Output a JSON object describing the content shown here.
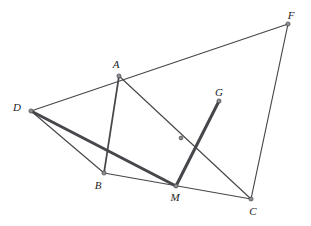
{
  "figure": {
    "canvas": {
      "width": 311,
      "height": 226
    },
    "background_color": "#ffffff",
    "line_color": "#46464b",
    "vertex_color": "#8d8d93",
    "label_color": "#1c1c1e",
    "points": [
      {
        "id": "D",
        "label": "D",
        "x": 31,
        "y": 111,
        "label_x": 17,
        "label_y": 107,
        "labeled": true
      },
      {
        "id": "A",
        "label": "A",
        "x": 119,
        "y": 76,
        "label_x": 116,
        "label_y": 64,
        "labeled": true
      },
      {
        "id": "F",
        "label": "F",
        "x": 288,
        "y": 24,
        "label_x": 291,
        "label_y": 15,
        "labeled": true
      },
      {
        "id": "G",
        "label": "G",
        "x": 219,
        "y": 101,
        "label_x": 219,
        "label_y": 92,
        "labeled": true
      },
      {
        "id": "B",
        "label": "B",
        "x": 104,
        "y": 173,
        "label_x": 98,
        "label_y": 185,
        "labeled": true
      },
      {
        "id": "M",
        "label": "M",
        "x": 176,
        "y": 186,
        "label_x": 175,
        "label_y": 197,
        "labeled": true
      },
      {
        "id": "C",
        "label": "C",
        "x": 251,
        "y": 199,
        "label_x": 253,
        "label_y": 211,
        "labeled": true
      },
      {
        "id": "P",
        "label": "",
        "x": 181,
        "y": 138,
        "label_x": 181,
        "label_y": 138,
        "labeled": false
      }
    ],
    "segments": [
      {
        "id": "DF",
        "from": "D",
        "to": "F",
        "x1": 31,
        "y1": 111,
        "x2": 288,
        "y2": 24,
        "weight": "thin",
        "note": "D, A and F are collinear"
      },
      {
        "id": "FC",
        "from": "F",
        "to": "C",
        "x1": 288,
        "y1": 24,
        "x2": 251,
        "y2": 199,
        "weight": "thin",
        "note": ""
      },
      {
        "id": "DB",
        "from": "D",
        "to": "B",
        "x1": 31,
        "y1": 111,
        "x2": 104,
        "y2": 173,
        "weight": "thin",
        "note": ""
      },
      {
        "id": "BC",
        "from": "B",
        "to": "C",
        "x1": 104,
        "y1": 173,
        "x2": 251,
        "y2": 199,
        "weight": "thin",
        "note": "passes through M"
      },
      {
        "id": "DM",
        "from": "D",
        "to": "M",
        "x1": 31,
        "y1": 111,
        "x2": 176,
        "y2": 186,
        "weight": "thick",
        "note": "emphasised"
      },
      {
        "id": "AB",
        "from": "A",
        "to": "B",
        "x1": 119,
        "y1": 76,
        "x2": 104,
        "y2": 173,
        "weight": "medium",
        "note": ""
      },
      {
        "id": "AC",
        "from": "A",
        "to": "C",
        "x1": 119,
        "y1": 76,
        "x2": 251,
        "y2": 199,
        "weight": "thin",
        "note": "crosses MG at unlabeled point"
      },
      {
        "id": "MG",
        "from": "M",
        "to": "G",
        "x1": 176,
        "y1": 186,
        "x2": 219,
        "y2": 101,
        "weight": "thick",
        "note": "emphasised"
      }
    ]
  }
}
